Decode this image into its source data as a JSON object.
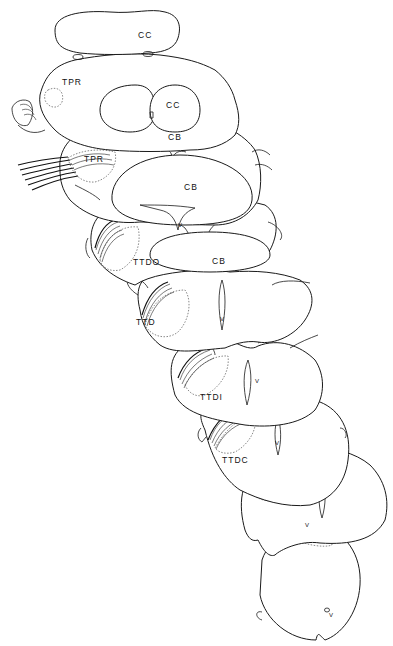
{
  "figure": {
    "type": "serial brain section drawings",
    "sections": [
      {
        "id": 1,
        "labels": [
          "CC"
        ]
      },
      {
        "id": 2,
        "labels": [
          "TPR",
          "CC"
        ]
      },
      {
        "id": 3,
        "labels": [
          "CB",
          "TPR"
        ]
      },
      {
        "id": 4,
        "labels": [
          "CB",
          "V",
          "TTDO"
        ]
      },
      {
        "id": 5,
        "labels": [
          "CB",
          "V",
          "TTD"
        ]
      },
      {
        "id": 6,
        "labels": [
          "V",
          "TTDI"
        ]
      },
      {
        "id": 7,
        "labels": [
          "V",
          "TTDC"
        ]
      },
      {
        "id": 8,
        "labels": [
          "V"
        ]
      },
      {
        "id": 9,
        "labels": [
          "V"
        ]
      }
    ]
  },
  "labels": {
    "cc1": "CC",
    "tpr1": "TPR",
    "cc2": "CC",
    "cb1": "CB",
    "tpr2": "TPR",
    "cb2": "CB",
    "v1": "V",
    "ttdo": "TTDO",
    "cb3": "CB",
    "v2": "V",
    "ttd": "TTD",
    "v3": "V",
    "ttdi": "TTDI",
    "ttdc": "TTDC",
    "v4": "V",
    "v5": "V",
    "v6": "V"
  }
}
